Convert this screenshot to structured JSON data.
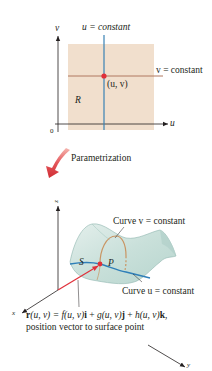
{
  "top_diagram": {
    "axis_v_label": "v",
    "axis_u_label": "u",
    "origin_label": "0",
    "region_label": "R",
    "point_label": "(u, v)",
    "u_constant_label": "u = constant",
    "v_constant_label": "v = constant",
    "colors": {
      "region_fill": "#f1dfcd",
      "u_line": "#3a82b4",
      "v_line": "#b07860",
      "point": "#e0303a",
      "axis": "#231f20"
    }
  },
  "transition": {
    "label": "Parametrization",
    "arrow_color": "#d6363c"
  },
  "bottom_diagram": {
    "axis_z_label": "z",
    "axis_x_label": "x",
    "axis_y_label": "y",
    "surface_label": "S",
    "point_label": "P",
    "curve_v_label": "Curve v = constant",
    "curve_u_label": "Curve u = constant",
    "equation": {
      "r": "r",
      "args": "(u, v) = ",
      "f": "f",
      "f_args": "(u, v)",
      "i": "i",
      "plus1": " + ",
      "g": "g",
      "g_args": "(u, v)",
      "j": "j",
      "plus2": " + ",
      "h": "h",
      "h_args": "(u, v)",
      "k": "k",
      "comma": ","
    },
    "caption": "position vector to surface point",
    "colors": {
      "surface_fill": "#cfe4df",
      "surface_edge": "#8fb6ae",
      "curve_u": "#2f7fb8",
      "curve_v": "#c99563",
      "vector": "#e0303a",
      "point": "#e0303a",
      "axis": "#231f20"
    }
  }
}
